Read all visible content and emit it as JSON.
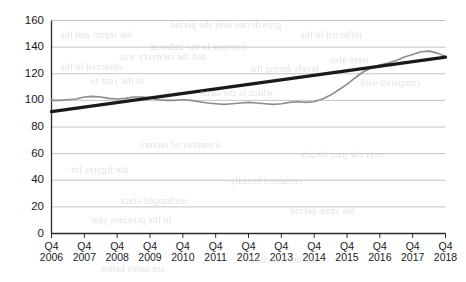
{
  "chart_data": {
    "type": "line",
    "title": "",
    "subtitle": "",
    "xlabel": "",
    "ylabel": "",
    "ylim": [
      0,
      160
    ],
    "ytick_values": [
      0,
      20,
      40,
      60,
      80,
      100,
      120,
      140,
      160
    ],
    "ytick_labels": [
      "0",
      "20",
      "40",
      "60",
      "80",
      "100",
      "120",
      "140",
      "160"
    ],
    "grid": "horizontal",
    "legend": "none",
    "categories": [
      "Q4 2006",
      "Q4 2007",
      "Q4 2008",
      "Q4 2009",
      "Q4 2010",
      "Q4 2011",
      "Q4 2012",
      "Q4 2013",
      "Q4 2014",
      "Q4 2015",
      "Q4 2016",
      "Q4 2017",
      "Q4 2018"
    ],
    "xtick_labels": [
      {
        "quarter": "Q4",
        "year": "2006"
      },
      {
        "quarter": "Q4",
        "year": "2007"
      },
      {
        "quarter": "Q4",
        "year": "2008"
      },
      {
        "quarter": "Q4",
        "year": "2009"
      },
      {
        "quarter": "Q4",
        "year": "2010"
      },
      {
        "quarter": "Q4",
        "year": "2011"
      },
      {
        "quarter": "Q4",
        "year": "2012"
      },
      {
        "quarter": "Q4",
        "year": "2013"
      },
      {
        "quarter": "Q4",
        "year": "2014"
      },
      {
        "quarter": "Q4",
        "year": "2015"
      },
      {
        "quarter": "Q4",
        "year": "2016"
      },
      {
        "quarter": "Q4",
        "year": "2017"
      },
      {
        "quarter": "Q4",
        "year": "2018"
      }
    ],
    "series": [
      {
        "name": "index",
        "color": "#8c8c8c",
        "width": 1.6,
        "x": [
          0,
          0.25,
          0.5,
          0.75,
          1,
          1.25,
          1.5,
          1.75,
          2,
          2.25,
          2.5,
          2.75,
          3,
          3.25,
          3.5,
          3.75,
          4,
          4.25,
          4.5,
          4.75,
          5,
          5.25,
          5.5,
          5.75,
          6,
          6.25,
          6.5,
          6.75,
          7,
          7.25,
          7.5,
          7.75,
          8,
          8.25,
          8.5,
          8.75,
          9,
          9.25,
          9.5,
          9.75,
          10,
          10.25,
          10.5,
          10.75,
          11,
          11.25,
          11.5,
          11.75,
          12
        ],
        "values": [
          100,
          100,
          100.5,
          101,
          102.5,
          103,
          102.5,
          101.5,
          101,
          101.5,
          102.5,
          102.5,
          102,
          100.5,
          100,
          100,
          100.5,
          100,
          99,
          98,
          97.5,
          97,
          97.5,
          98,
          98.5,
          98,
          97.5,
          97,
          97.5,
          98.5,
          99,
          98.5,
          99,
          101,
          104,
          108,
          112,
          117,
          121.5,
          124.5,
          126.5,
          128,
          130,
          132.5,
          134.5,
          136.5,
          137,
          135.5,
          133
        ]
      },
      {
        "name": "linear trend",
        "color": "#1a1a1a",
        "width": 3.2,
        "x": [
          0,
          12
        ],
        "values": [
          91.5,
          132.5
        ]
      }
    ],
    "axis_color": "#2b2b2b",
    "grid_color": "#c4c4c4",
    "background_color": "#ffffff"
  },
  "artifacts": {
    "note": "faint mirrored bleed-through text from reverse side of scanned page",
    "lines": [
      {
        "text": "the report and the",
        "left": 60,
        "top": 30
      },
      {
        "text": "increase in the index of",
        "left": 150,
        "top": 42
      },
      {
        "text": "reflected in the",
        "left": 300,
        "top": 30
      },
      {
        "text": "were also",
        "left": 330,
        "top": 55
      },
      {
        "text": "and the recovery was",
        "left": 120,
        "top": 52
      },
      {
        "text": "levels during the",
        "left": 250,
        "top": 64
      },
      {
        "text": "observed in the",
        "left": 60,
        "top": 62
      },
      {
        "text": "growth rate over the period",
        "left": 170,
        "top": 20
      },
      {
        "text": "compared with",
        "left": 360,
        "top": 78
      },
      {
        "text": "in the year to",
        "left": 90,
        "top": 76
      },
      {
        "text": "which is the same",
        "left": 200,
        "top": 88
      },
      {
        "text": "a number of sectors",
        "left": 140,
        "top": 140
      },
      {
        "text": "over the past decade",
        "left": 300,
        "top": 150
      },
      {
        "text": "the figures for",
        "left": 70,
        "top": 165
      },
      {
        "text": "remained broadly",
        "left": 230,
        "top": 176
      },
      {
        "text": "unchanged since",
        "left": 120,
        "top": 196
      },
      {
        "text": "the same period",
        "left": 290,
        "top": 206
      },
      {
        "text": "in the previous year",
        "left": 90,
        "top": 215
      },
      {
        "text": "has been revised",
        "left": 250,
        "top": 255
      },
      {
        "text": "see notes below",
        "left": 100,
        "top": 264
      }
    ]
  }
}
